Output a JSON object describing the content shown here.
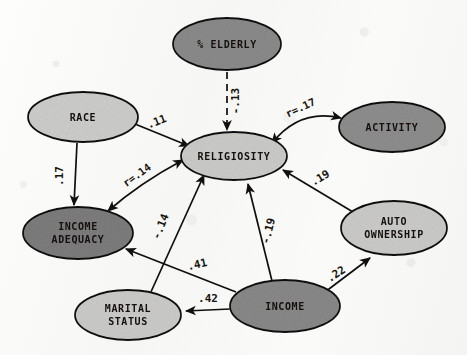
{
  "figure": {
    "type": "path-diagram",
    "nodes": [
      {
        "id": "elderly",
        "label_lines": [
          "% ELDERLY"
        ],
        "shade": "dark",
        "cx": 227,
        "cy": 44,
        "rx": 54,
        "ry": 26,
        "fill": "#8c8c8c"
      },
      {
        "id": "race",
        "label_lines": [
          "RACE"
        ],
        "shade": "light",
        "cx": 83,
        "cy": 117,
        "rx": 55,
        "ry": 25,
        "fill": "#cfcfcd"
      },
      {
        "id": "religiosity",
        "label_lines": [
          "RELIGIOSITY"
        ],
        "shade": "light",
        "cx": 234,
        "cy": 156,
        "rx": 53,
        "ry": 24,
        "fill": "#cdcdcb"
      },
      {
        "id": "activity",
        "label_lines": [
          "ACTIVITY"
        ],
        "shade": "dark",
        "cx": 392,
        "cy": 127,
        "rx": 53,
        "ry": 25,
        "fill": "#8f8f8f"
      },
      {
        "id": "income_adequacy",
        "label_lines": [
          "INCOME",
          "ADEQUACY"
        ],
        "shade": "dark",
        "cx": 78,
        "cy": 233,
        "rx": 55,
        "ry": 26,
        "fill": "#7e7e7e"
      },
      {
        "id": "auto_ownership",
        "label_lines": [
          "AUTO",
          "OWNERSHIP"
        ],
        "shade": "light",
        "cx": 394,
        "cy": 228,
        "rx": 53,
        "ry": 27,
        "fill": "#cdcdcb"
      },
      {
        "id": "marital_status",
        "label_lines": [
          "MARITAL",
          "STATUS"
        ],
        "shade": "light",
        "cx": 128,
        "cy": 315,
        "rx": 53,
        "ry": 25,
        "fill": "#cdcdcb"
      },
      {
        "id": "income",
        "label_lines": [
          "INCOME"
        ],
        "shade": "dark",
        "cx": 285,
        "cy": 306,
        "rx": 55,
        "ry": 26,
        "fill": "#8a8a8a"
      }
    ],
    "edges": [
      {
        "id": "elderly-religiosity",
        "from": "elderly",
        "to": "religiosity",
        "label": "-.13",
        "style": "dashed",
        "arrow": "single",
        "label_rotation": -90
      },
      {
        "id": "race-religiosity",
        "from": "race",
        "to": "religiosity",
        "label": ".11",
        "style": "solid",
        "arrow": "single",
        "label_rotation": -22
      },
      {
        "id": "race-income-adequacy",
        "from": "race",
        "to": "income_adequacy",
        "label": ".17",
        "style": "solid",
        "arrow": "single",
        "label_rotation": -90
      },
      {
        "id": "religiosity-activity",
        "from": "religiosity",
        "to": "activity",
        "label": "r=.17",
        "style": "curved",
        "arrow": "double",
        "label_rotation": -26
      },
      {
        "id": "income-adequacy-religiosity",
        "from": "income_adequacy",
        "to": "religiosity",
        "label": "r=.14",
        "style": "curved",
        "arrow": "double",
        "label_rotation": -38
      },
      {
        "id": "marital-religiosity",
        "from": "marital_status",
        "to": "religiosity",
        "label": "-.14",
        "style": "solid",
        "arrow": "single",
        "label_rotation": -72
      },
      {
        "id": "income-religiosity",
        "from": "income",
        "to": "religiosity",
        "label": "-.19",
        "style": "solid",
        "arrow": "single",
        "label_rotation": -73
      },
      {
        "id": "auto-religiosity",
        "from": "auto_ownership",
        "to": "religiosity",
        "label": ".19",
        "style": "solid",
        "arrow": "single",
        "label_rotation": -31
      },
      {
        "id": "income-income-adequacy",
        "from": "income",
        "to": "income_adequacy",
        "label": ".41",
        "style": "solid",
        "arrow": "single",
        "label_rotation": -11
      },
      {
        "id": "income-marital",
        "from": "income",
        "to": "marital_status",
        "label": ".42",
        "style": "solid",
        "arrow": "single",
        "label_rotation": 0
      },
      {
        "id": "income-auto",
        "from": "income",
        "to": "auto_ownership",
        "label": ".22",
        "style": "solid",
        "arrow": "single",
        "label_rotation": -31
      }
    ]
  }
}
